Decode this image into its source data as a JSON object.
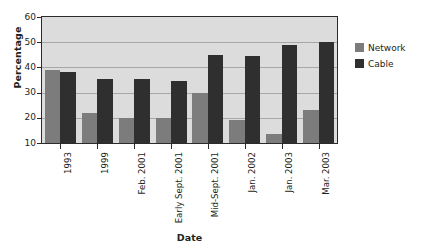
{
  "chart_data": {
    "type": "bar",
    "title": "",
    "xlabel": "Date",
    "ylabel": "Percentage",
    "ylim": [
      10,
      60
    ],
    "yticks": [
      10,
      20,
      30,
      40,
      50,
      60
    ],
    "grid": true,
    "legend_position": "right",
    "categories": [
      "1993",
      "1999",
      "Feb. 2001",
      "Early Sept. 2001",
      "Mid-Sept. 2001",
      "Jan. 2002",
      "Jan. 2003",
      "Mar. 2003"
    ],
    "series": [
      {
        "name": "Network",
        "color": "#7c7c7c",
        "values": [
          39,
          22,
          20,
          20,
          30,
          19,
          13.5,
          23
        ]
      },
      {
        "name": "Cable",
        "color": "#2f2f2f",
        "values": [
          38,
          35.5,
          35.5,
          34.5,
          45,
          44.5,
          49,
          50
        ]
      }
    ]
  },
  "legend": {
    "items": [
      {
        "label": "Network",
        "color": "#7c7c7c"
      },
      {
        "label": "Cable",
        "color": "#2f2f2f"
      }
    ]
  },
  "axes": {
    "y_title": "Percentage",
    "x_title": "Date"
  },
  "colors": {
    "plot_background": "#dcdcdc",
    "grid": "#a7a7a7",
    "axis": "#2b2b2b",
    "text": "#231f20",
    "network": "#7c7c7c",
    "cable": "#2f2f2f"
  }
}
